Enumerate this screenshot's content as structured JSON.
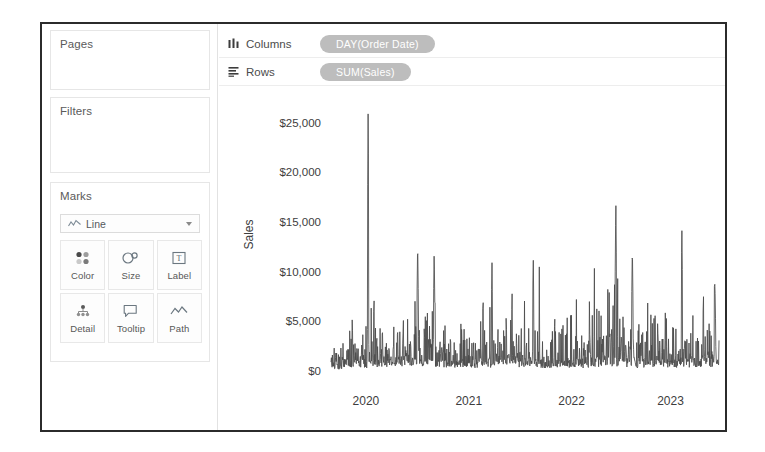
{
  "sidebar": {
    "pages": {
      "title": "Pages"
    },
    "filters": {
      "title": "Filters"
    },
    "marks": {
      "title": "Marks",
      "type_select": {
        "value": "Line",
        "icon": "line-chart-icon",
        "caret": "chevron-down-icon"
      },
      "buttons": [
        {
          "label": "Color",
          "icon": "color-palette-icon"
        },
        {
          "label": "Size",
          "icon": "size-circles-icon"
        },
        {
          "label": "Label",
          "icon": "label-text-icon"
        },
        {
          "label": "Detail",
          "icon": "detail-hierarchy-icon"
        },
        {
          "label": "Tooltip",
          "icon": "tooltip-bubble-icon"
        },
        {
          "label": "Path",
          "icon": "path-line-icon"
        }
      ]
    }
  },
  "shelves": [
    {
      "name": "columns",
      "label": "Columns",
      "icon": "columns-icon",
      "pill": "DAY(Order Date)"
    },
    {
      "name": "rows",
      "label": "Rows",
      "icon": "rows-icon",
      "pill": "SUM(Sales)"
    }
  ],
  "colors": {
    "pill_fill": "#bdbdbd",
    "pill_text": "#ffffff",
    "line": "#4a4a4a",
    "border": "#2b2b2b",
    "card_border": "#e6e6e6"
  },
  "chart_data": {
    "type": "line",
    "title": "",
    "xlabel": "",
    "ylabel": "Sales",
    "ylim": [
      0,
      27500
    ],
    "yticks": [
      0,
      5000,
      10000,
      15000,
      20000,
      25000
    ],
    "ytick_labels": [
      "$0",
      "$5,000",
      "$10,000",
      "$15,000",
      "$20,000",
      "$25,000"
    ],
    "xticks": [
      "2020",
      "2021",
      "2022",
      "2023"
    ],
    "xtick_positions": [
      0.09,
      0.355,
      0.62,
      0.875
    ],
    "grid": false,
    "legend": null,
    "series": [
      {
        "name": "SUM(Sales)",
        "aggregation": "DAY(Order Date)",
        "notable_points": [
          {
            "x": "2020-03",
            "y": 27500,
            "note": "maximum spike"
          },
          {
            "x": "2020-09",
            "y": 13500
          },
          {
            "x": "2020-11",
            "y": 12500
          },
          {
            "x": "2021-06",
            "y": 11000
          },
          {
            "x": "2021-11",
            "y": 11500
          },
          {
            "x": "2022-09",
            "y": 18000,
            "note": "second highest spike"
          },
          {
            "x": "2022-11",
            "y": 13000
          },
          {
            "x": "2023-05",
            "y": 15000
          },
          {
            "x": "2023-09",
            "y": 9500
          }
        ],
        "baseline": 300,
        "typical_range": [
          200,
          4000
        ],
        "description": "Dense daily sales time series, highly spiky noise floor under $5,000 with periodic peaks"
      }
    ]
  }
}
